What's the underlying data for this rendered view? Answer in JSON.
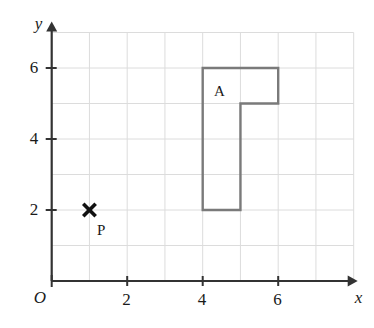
{
  "figure": {
    "type": "coordinate-grid-diagram",
    "title": "",
    "background_color": "#ffffff",
    "grid_color": "#dcdcdc",
    "axis_color": "#333333",
    "shape_color": "#7a7a7a",
    "marker_color": "#111111",
    "text_color": "#1a1a1a"
  },
  "axes": {
    "origin_label": "O",
    "x": {
      "label": "x",
      "tick_labels": [
        "2",
        "4",
        "6"
      ],
      "tick_values": [
        2,
        4,
        6
      ],
      "min": 0,
      "max": 8,
      "arrow": true
    },
    "y": {
      "label": "y",
      "tick_labels": [
        "2",
        "4",
        "6"
      ],
      "tick_values": [
        2,
        4,
        6
      ],
      "min": 0,
      "max": 7.2,
      "arrow": true
    }
  },
  "grid": {
    "visible": true,
    "x_lines": [
      0,
      1,
      2,
      3,
      4,
      5,
      6,
      7,
      8
    ],
    "y_lines": [
      0,
      1,
      2,
      3,
      4,
      5,
      6,
      7
    ]
  },
  "shapes": [
    {
      "name": "A",
      "label": "A",
      "label_point": [
        4.3,
        5.55
      ],
      "fill": "none",
      "stroke": "#7a7a7a",
      "stroke_width": 2.4,
      "vertices": [
        [
          4,
          6
        ],
        [
          6,
          6
        ],
        [
          6,
          5
        ],
        [
          5,
          5
        ],
        [
          5,
          2
        ],
        [
          4,
          2
        ]
      ]
    }
  ],
  "points": [
    {
      "name": "P",
      "label": "P",
      "coords": [
        1,
        2
      ],
      "marker": "cross-x",
      "label_point": [
        1.2,
        1.62
      ]
    }
  ]
}
